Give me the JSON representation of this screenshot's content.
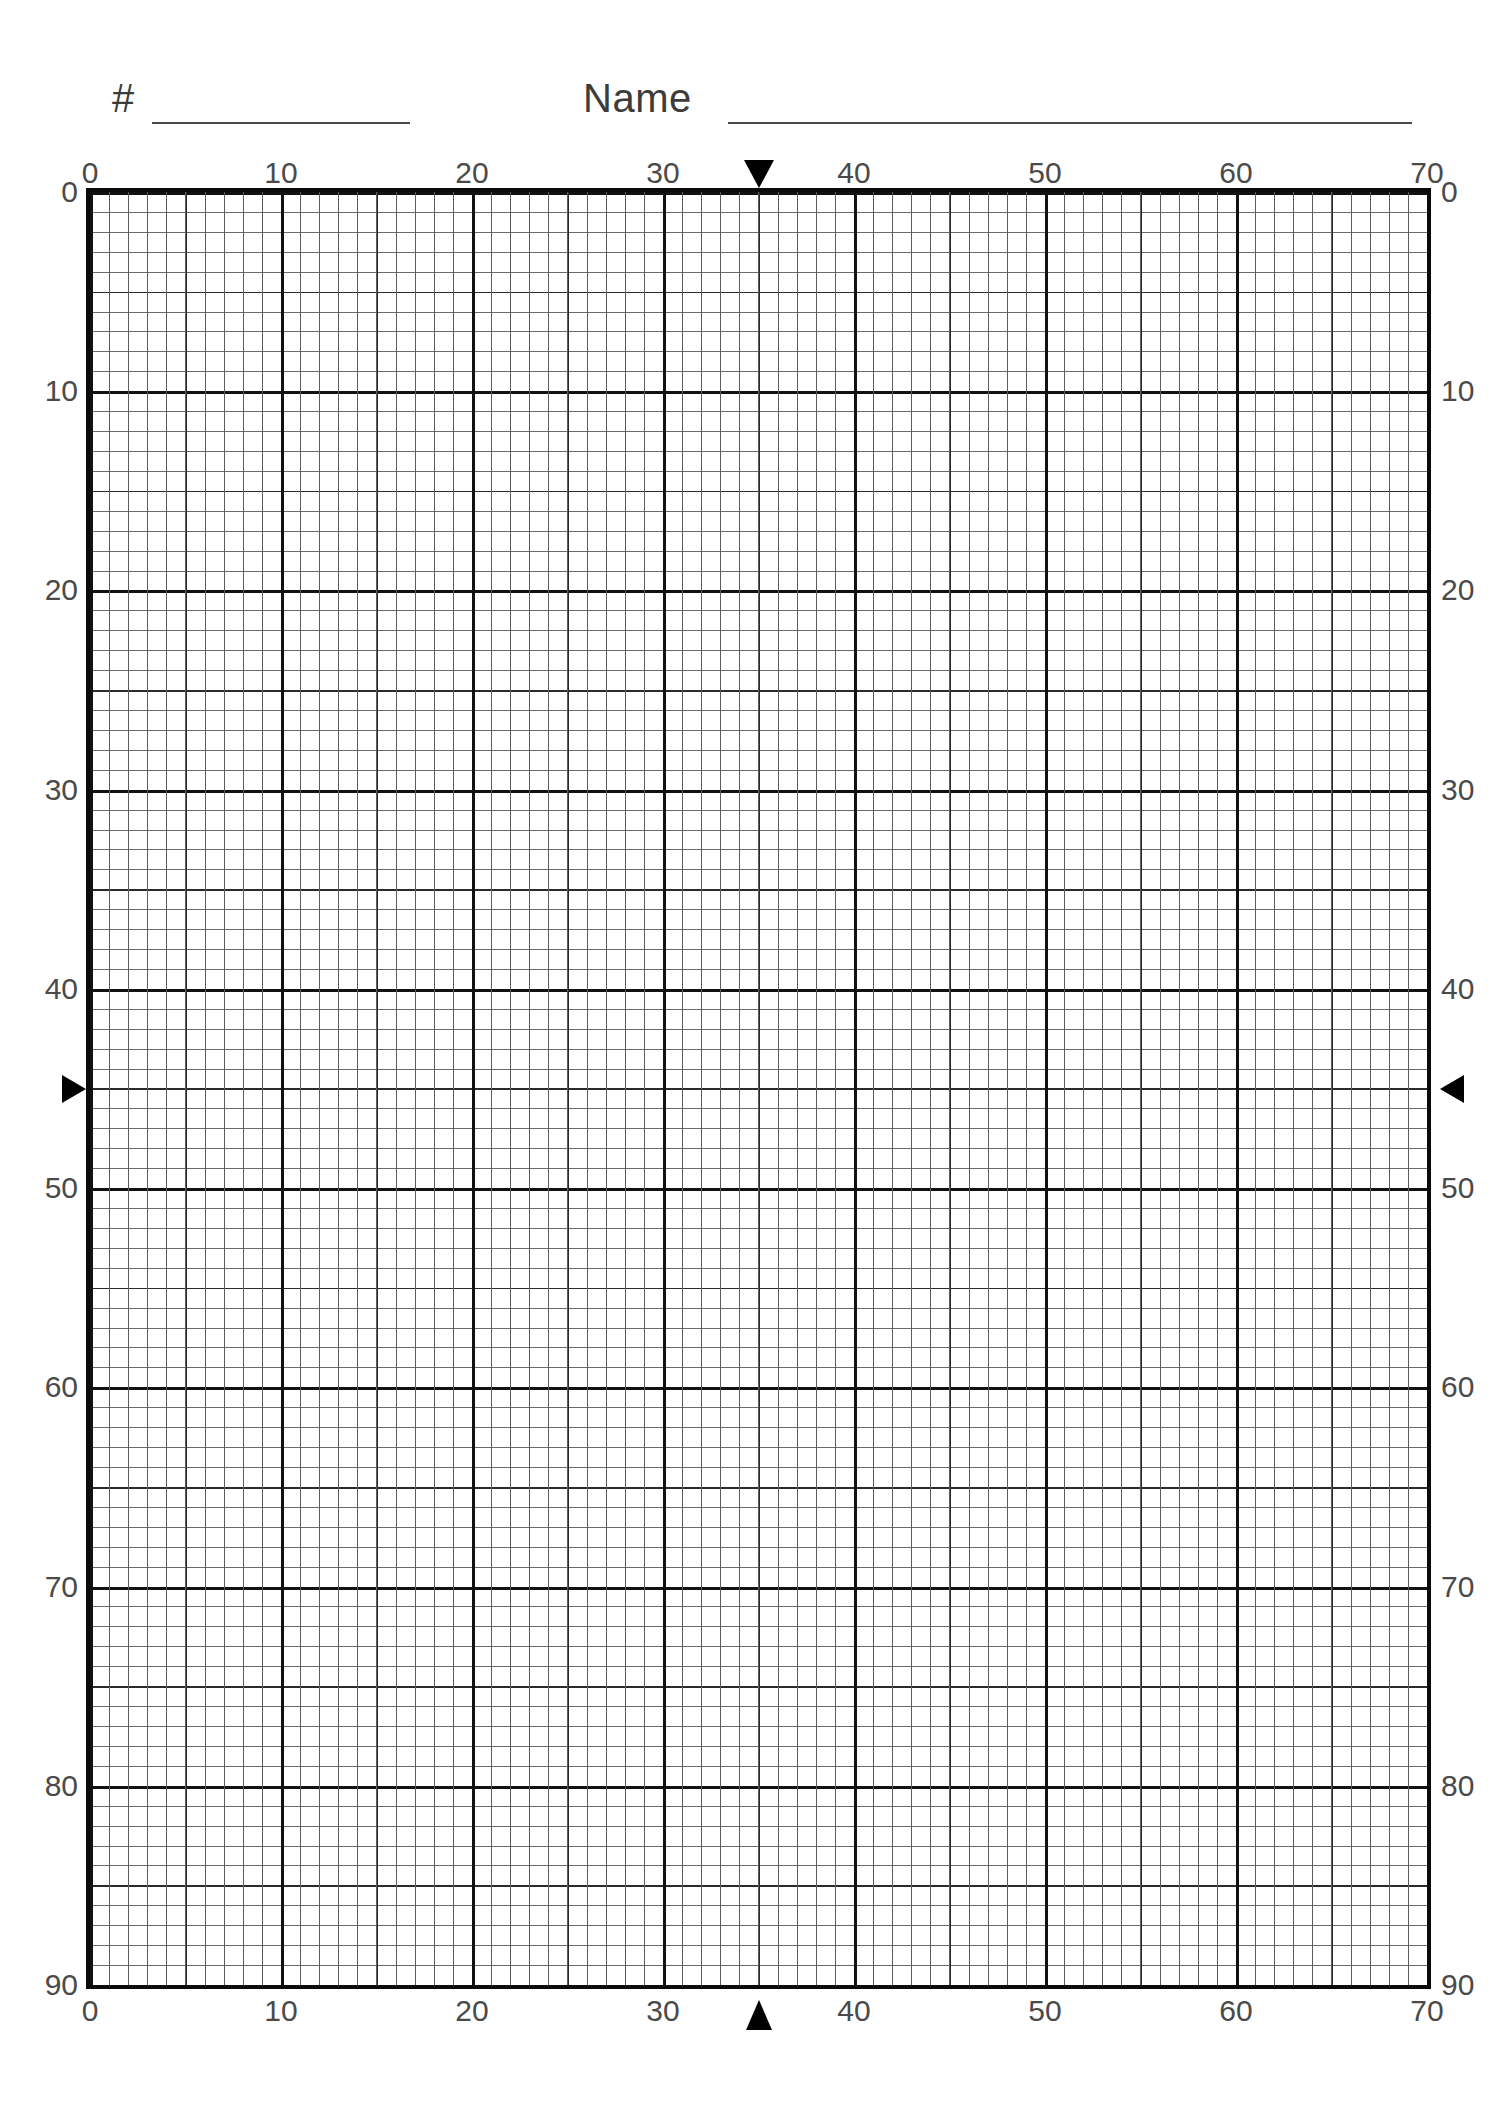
{
  "page": {
    "background_color": "#ffffff",
    "ink_color": "#3a3a3a"
  },
  "header": {
    "number_label": "#",
    "name_label": "Name",
    "number_value": "",
    "name_value": "",
    "number_placeholder": "",
    "name_placeholder": ""
  },
  "chart_data": {
    "type": "table",
    "title": "",
    "xlabel": "",
    "ylabel": "",
    "grid": true,
    "legend": false,
    "xlim": [
      0,
      70
    ],
    "ylim": [
      0,
      90
    ],
    "y_direction": "descending",
    "minor_step": 1,
    "mid_step": 5,
    "major_step": 10,
    "series": [],
    "values": [],
    "categories": [],
    "axes": {
      "top": {
        "min": 0,
        "max": 70,
        "ticks": [
          0,
          10,
          20,
          30,
          40,
          50,
          60,
          70
        ],
        "tick_labels": [
          "0",
          "10",
          "20",
          "30",
          "40",
          "50",
          "60",
          "70"
        ]
      },
      "bottom": {
        "min": 0,
        "max": 70,
        "ticks": [
          0,
          10,
          20,
          30,
          40,
          50,
          60,
          70
        ],
        "tick_labels": [
          "0",
          "10",
          "20",
          "30",
          "40",
          "50",
          "60",
          "70"
        ]
      },
      "left": {
        "min": 0,
        "max": 90,
        "ticks": [
          0,
          10,
          20,
          30,
          40,
          50,
          60,
          70,
          80,
          90
        ],
        "tick_labels": [
          "0",
          "10",
          "20",
          "30",
          "40",
          "50",
          "60",
          "70",
          "80",
          "90"
        ]
      },
      "right": {
        "min": 0,
        "max": 90,
        "ticks": [
          0,
          10,
          20,
          30,
          40,
          50,
          60,
          70,
          80,
          90
        ],
        "tick_labels": [
          "0",
          "10",
          "20",
          "30",
          "40",
          "50",
          "60",
          "70",
          "80",
          "90"
        ]
      }
    },
    "markers": [
      {
        "name": "top-marker",
        "glyph": "down-triangle",
        "axis": "top",
        "value": 35
      },
      {
        "name": "bottom-marker",
        "glyph": "up-triangle",
        "axis": "bottom",
        "value": 35
      },
      {
        "name": "left-marker",
        "glyph": "right-triangle",
        "axis": "left",
        "value": 45
      },
      {
        "name": "right-marker",
        "glyph": "left-triangle",
        "axis": "right",
        "value": 45
      }
    ]
  }
}
